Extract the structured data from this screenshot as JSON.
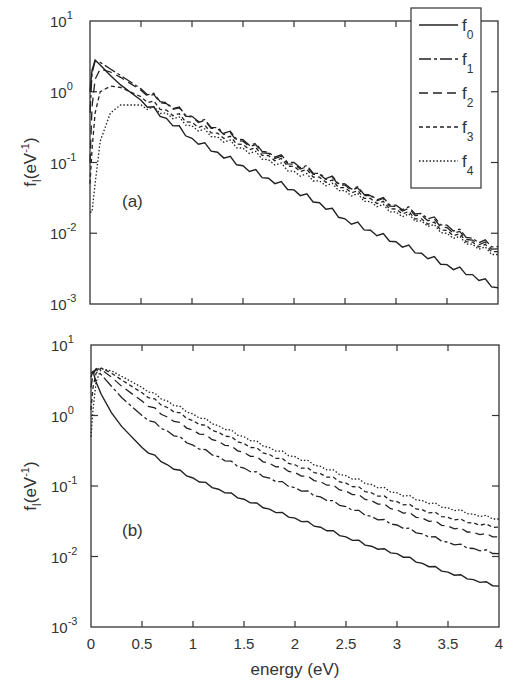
{
  "chart_data": [
    {
      "type": "line",
      "panel_label": "(a)",
      "xlabel": "",
      "ylabel": "f_l(eV^-1)",
      "yscale": "log",
      "xlim": [
        0,
        4
      ],
      "ylim": [
        0.001,
        10
      ],
      "x_ticks": [
        0,
        0.5,
        1,
        1.5,
        2,
        2.5,
        3,
        3.5,
        4
      ],
      "y_ticks": [
        "10^1",
        "10^0",
        "10^-1",
        "10^-2",
        "10^-3"
      ],
      "grid": false,
      "legend_position": "upper right",
      "legend": [
        "f0",
        "f1",
        "f2",
        "f3",
        "f4"
      ],
      "x": [
        0.0,
        0.02,
        0.05,
        0.1,
        0.2,
        0.3,
        0.5,
        0.75,
        1.0,
        1.25,
        1.5,
        1.75,
        2.0,
        2.25,
        2.5,
        2.75,
        3.0,
        3.25,
        3.5,
        3.75,
        4.0
      ],
      "series": [
        {
          "name": "f0",
          "style": "solid",
          "values": [
            1.0,
            2.0,
            2.8,
            2.4,
            1.7,
            1.25,
            0.76,
            0.42,
            0.22,
            0.14,
            0.09,
            0.06,
            0.041,
            0.027,
            0.016,
            0.011,
            0.0076,
            0.0052,
            0.0036,
            0.0026,
            0.0017
          ]
        },
        {
          "name": "f1",
          "style": "dashdot",
          "values": [
            0.5,
            1.8,
            2.7,
            2.6,
            2.1,
            1.7,
            1.1,
            0.7,
            0.45,
            0.31,
            0.21,
            0.14,
            0.1,
            0.07,
            0.05,
            0.035,
            0.025,
            0.019,
            0.013,
            0.0085,
            0.0065
          ]
        },
        {
          "name": "f2",
          "style": "dashed",
          "values": [
            0.1,
            0.6,
            1.5,
            2.1,
            1.9,
            1.6,
            1.05,
            0.68,
            0.44,
            0.3,
            0.2,
            0.135,
            0.095,
            0.068,
            0.048,
            0.034,
            0.024,
            0.018,
            0.012,
            0.008,
            0.006
          ]
        },
        {
          "name": "f3",
          "style": "short-dash",
          "values": [
            0.05,
            0.15,
            0.5,
            1.0,
            1.2,
            1.15,
            0.85,
            0.55,
            0.37,
            0.26,
            0.18,
            0.125,
            0.088,
            0.062,
            0.044,
            0.031,
            0.022,
            0.016,
            0.011,
            0.0075,
            0.0055
          ]
        },
        {
          "name": "f4",
          "style": "dotted",
          "values": [
            0.02,
            0.02,
            0.05,
            0.2,
            0.5,
            0.65,
            0.65,
            0.5,
            0.33,
            0.23,
            0.16,
            0.11,
            0.075,
            0.055,
            0.04,
            0.028,
            0.02,
            0.015,
            0.01,
            0.007,
            0.005
          ]
        }
      ]
    },
    {
      "type": "line",
      "panel_label": "(b)",
      "xlabel": "energy (eV)",
      "ylabel": "f_l(eV^-1)",
      "yscale": "log",
      "xlim": [
        0,
        4
      ],
      "ylim": [
        0.001,
        10
      ],
      "x_ticks": [
        0,
        0.5,
        1,
        1.5,
        2,
        2.5,
        3,
        3.5,
        4
      ],
      "y_ticks": [
        "10^1",
        "10^0",
        "10^-1",
        "10^-2",
        "10^-3"
      ],
      "grid": false,
      "x": [
        0.0,
        0.02,
        0.05,
        0.1,
        0.2,
        0.3,
        0.5,
        0.75,
        1.0,
        1.25,
        1.5,
        1.75,
        2.0,
        2.25,
        2.5,
        2.75,
        3.0,
        3.25,
        3.5,
        3.75,
        4.0
      ],
      "series": [
        {
          "name": "f0",
          "style": "solid",
          "values": [
            4.0,
            4.2,
            3.0,
            2.0,
            1.1,
            0.7,
            0.35,
            0.2,
            0.13,
            0.09,
            0.065,
            0.047,
            0.035,
            0.026,
            0.019,
            0.014,
            0.011,
            0.008,
            0.006,
            0.0047,
            0.0038
          ]
        },
        {
          "name": "f1",
          "style": "dashdot",
          "values": [
            3.5,
            4.2,
            4.5,
            3.8,
            2.6,
            1.8,
            1.0,
            0.6,
            0.38,
            0.26,
            0.18,
            0.13,
            0.095,
            0.07,
            0.051,
            0.037,
            0.028,
            0.021,
            0.016,
            0.013,
            0.011
          ]
        },
        {
          "name": "f2",
          "style": "dashed",
          "values": [
            2.5,
            3.8,
            4.6,
            4.5,
            3.5,
            2.6,
            1.6,
            0.95,
            0.62,
            0.43,
            0.3,
            0.21,
            0.155,
            0.115,
            0.085,
            0.062,
            0.046,
            0.035,
            0.027,
            0.022,
            0.019
          ]
        },
        {
          "name": "f3",
          "style": "short-dash",
          "values": [
            1.2,
            2.5,
            4.0,
            4.7,
            4.0,
            3.2,
            2.1,
            1.3,
            0.85,
            0.58,
            0.4,
            0.28,
            0.2,
            0.15,
            0.11,
            0.08,
            0.06,
            0.046,
            0.036,
            0.03,
            0.026
          ]
        },
        {
          "name": "f4",
          "style": "dotted",
          "values": [
            0.5,
            1.2,
            3.0,
            4.6,
            4.3,
            3.6,
            2.5,
            1.6,
            1.05,
            0.72,
            0.5,
            0.35,
            0.26,
            0.19,
            0.14,
            0.105,
            0.08,
            0.062,
            0.049,
            0.04,
            0.034
          ]
        }
      ]
    }
  ],
  "panels": [
    {
      "label": "(a)",
      "ylabel_main": "f",
      "ylabel_sub": "l",
      "ylabel_rest": "(eV",
      "ylabel_sup": "-1",
      "ylabel_close": ")"
    },
    {
      "label": "(b)",
      "ylabel_main": "f",
      "ylabel_sub": "l",
      "ylabel_rest": "(eV",
      "ylabel_sup": "-1",
      "ylabel_close": ")"
    }
  ],
  "y_tick_labels": [
    {
      "base": "10",
      "exp": "1"
    },
    {
      "base": "10",
      "exp": "0"
    },
    {
      "base": "10",
      "exp": "-1"
    },
    {
      "base": "10",
      "exp": "-2"
    },
    {
      "base": "10",
      "exp": "-3"
    }
  ],
  "x_tick_labels": [
    "0",
    "0.5",
    "1",
    "1.5",
    "2",
    "2.5",
    "3",
    "3.5",
    "4"
  ],
  "xlabel": "energy (eV)",
  "legend": [
    {
      "base": "f",
      "sub": "0",
      "style": "solid"
    },
    {
      "base": "f",
      "sub": "1",
      "style": "dashdot"
    },
    {
      "base": "f",
      "sub": "2",
      "style": "dashed"
    },
    {
      "base": "f",
      "sub": "3",
      "style": "short-dash"
    },
    {
      "base": "f",
      "sub": "4",
      "style": "dotted"
    }
  ]
}
